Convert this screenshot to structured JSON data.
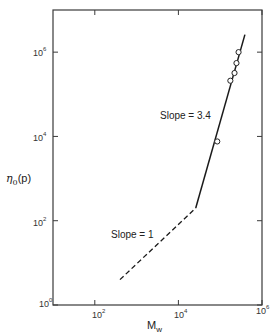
{
  "chart_data": {
    "type": "line",
    "title": "",
    "xlabel": "M_w",
    "ylabel": "η0(p)",
    "xscale": "log",
    "yscale": "log",
    "xlim": [
      10,
      1000000
    ],
    "ylim": [
      1,
      10000000
    ],
    "x_ticks": [
      100,
      10000,
      1000000
    ],
    "x_tick_labels": [
      "10^2",
      "10^4",
      "10^6"
    ],
    "y_ticks": [
      1,
      100,
      10000,
      1000000
    ],
    "y_tick_labels": [
      "10^0",
      "10^2",
      "10^4",
      "10^6"
    ],
    "grid": false,
    "legend": null,
    "series": [
      {
        "name": "Slope = 1 (dashed)",
        "style": "dashed",
        "x": [
          400,
          26000
        ],
        "y": [
          4,
          200
        ]
      },
      {
        "name": "Slope = 3.4 (solid)",
        "style": "solid",
        "x": [
          26000,
          390000
        ],
        "y": [
          200,
          2600000
        ]
      },
      {
        "name": "data points",
        "style": "open-circle",
        "x": [
          85000,
          175000,
          220000,
          245000,
          275000
        ],
        "y": [
          7600,
          210000,
          320000,
          550000,
          1000000
        ]
      }
    ],
    "annotations": [
      {
        "text": "Slope = 3.4",
        "near_x": 30000,
        "near_y": 20000
      },
      {
        "text": "Slope = 1",
        "near_x": 1000,
        "near_y": 40
      }
    ]
  },
  "labels": {
    "y_axis": "η",
    "y_axis_sub": "0",
    "y_axis_unit": "(p)",
    "x_axis": "M",
    "x_axis_sub": "w",
    "slope_high": "Slope = 3.4",
    "slope_low": "Slope = 1",
    "yt0_base": "10",
    "yt0_exp": "0",
    "yt2_base": "10",
    "yt2_exp": "2",
    "yt4_base": "10",
    "yt4_exp": "4",
    "yt6_base": "10",
    "yt6_exp": "6",
    "xt2_base": "10",
    "xt2_exp": "2",
    "xt4_base": "10",
    "xt4_exp": "4",
    "xt6_base": "10",
    "xt6_exp": "6"
  }
}
